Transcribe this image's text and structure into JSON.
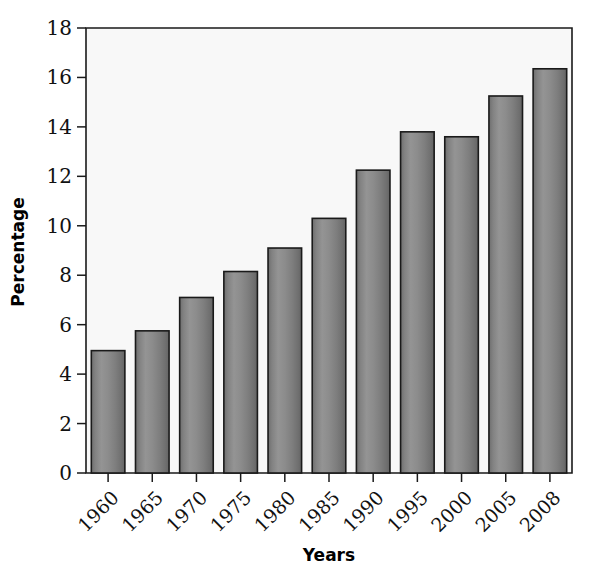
{
  "chart_data": {
    "type": "bar",
    "title": "",
    "xlabel": "Years",
    "ylabel": "Percentage",
    "categories": [
      "1960",
      "1965",
      "1970",
      "1975",
      "1980",
      "1985",
      "1990",
      "1995",
      "2000",
      "2005",
      "2008"
    ],
    "values": [
      4.95,
      5.75,
      7.1,
      8.15,
      9.1,
      10.3,
      12.25,
      13.8,
      13.6,
      15.25,
      16.35
    ],
    "ylim": [
      0,
      18
    ],
    "ytick_labels": [
      "0",
      "2",
      "4",
      "6",
      "8",
      "10",
      "12",
      "14",
      "16",
      "18"
    ],
    "ytick_values": [
      0,
      2,
      4,
      6,
      8,
      10,
      12,
      14,
      16,
      18
    ],
    "grid": false,
    "legend": false,
    "legend_position": "none",
    "bar_color": "#808080",
    "bar_edge_color": "#1a1a1a",
    "plot_background": "#f8f8f8",
    "xtick_label_rotation": 45
  }
}
